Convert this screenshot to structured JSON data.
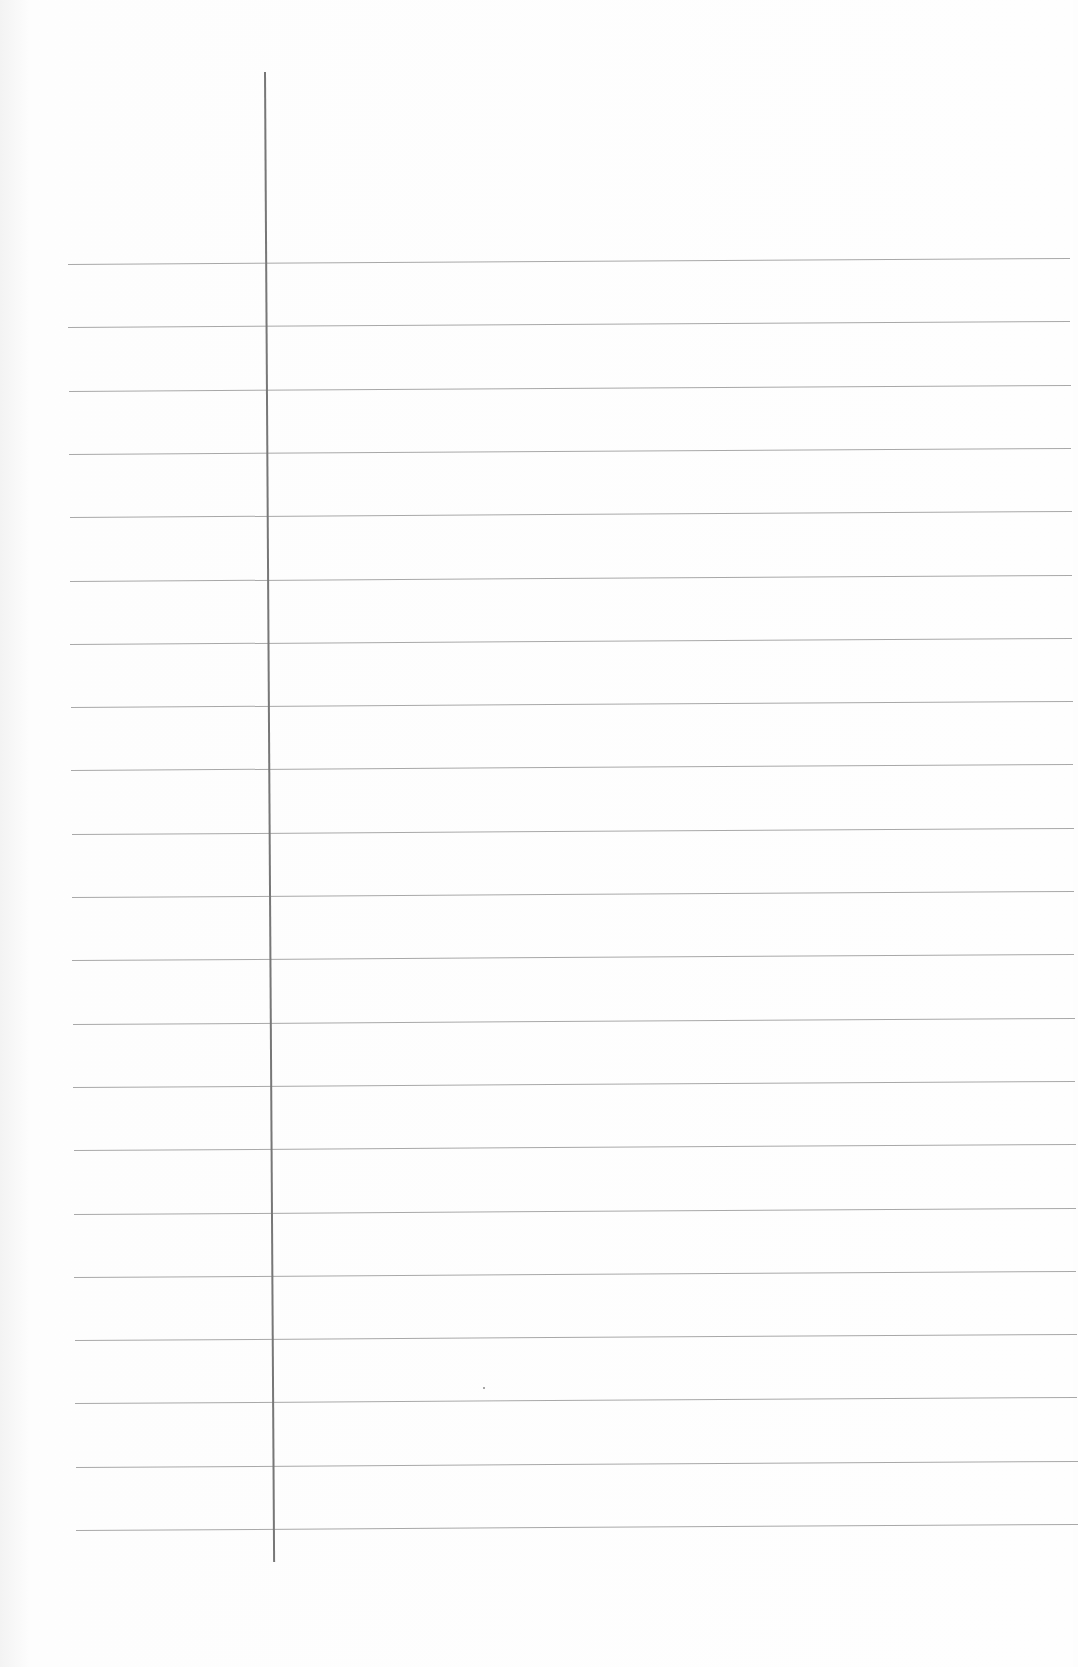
{
  "document": {
    "type": "lined-paper",
    "text_content": "",
    "margin_line": {
      "x": 264,
      "top": 72,
      "bottom": 1562,
      "color": "#777777"
    },
    "rules": {
      "count": 21,
      "left": 68,
      "right": 1070,
      "first_y": 264,
      "spacing": 63.3,
      "color": "#a8a8a8"
    }
  }
}
